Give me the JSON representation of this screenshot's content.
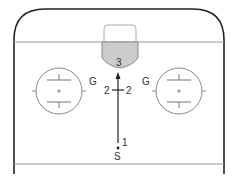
{
  "diagram": {
    "type": "hockey-drill",
    "colors": {
      "boards": "#222222",
      "lines": "#9a9a9a",
      "crease_fill": "#cccccc",
      "circle": "#888888",
      "path": "#222222"
    },
    "labels": {
      "crease_number": "3",
      "left_goalie": "G",
      "right_goalie": "G",
      "left_pass": "2",
      "right_pass": "2",
      "start_number": "1",
      "start_label": "S"
    }
  }
}
